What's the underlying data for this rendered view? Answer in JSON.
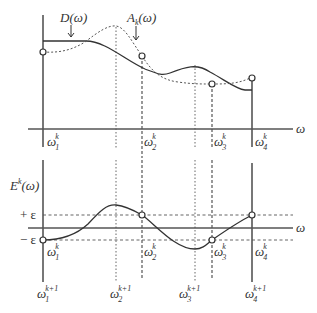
{
  "top_plot": {
    "label_D": "D(ω)",
    "label_A": "A",
    "label_A_sub": "k",
    "label_A_arg": "(ω)",
    "x_axis_label": "ω",
    "nodes": [
      {
        "base": "ω",
        "sub": "1",
        "sup": "k"
      },
      {
        "base": "ω",
        "sub": "2",
        "sup": "k"
      },
      {
        "base": "ω",
        "sub": "3",
        "sup": "k"
      },
      {
        "base": "ω",
        "sub": "4",
        "sup": "k"
      }
    ]
  },
  "bottom_plot": {
    "y_label": "E",
    "y_label_sup": "k",
    "y_label_arg": "(ω)",
    "x_axis_label": "ω",
    "plus_eps": "+ ε",
    "minus_eps": "− ε",
    "nodes_k": [
      {
        "base": "ω",
        "sub": "1",
        "sup": "k"
      },
      {
        "base": "ω",
        "sub": "2",
        "sup": "k"
      },
      {
        "base": "ω",
        "sub": "3",
        "sup": "k"
      },
      {
        "base": "ω",
        "sub": "4",
        "sup": "k"
      }
    ],
    "nodes_k1": [
      {
        "base": "ω",
        "sub": "1",
        "sup": "k+1"
      },
      {
        "base": "ω",
        "sub": "2",
        "sup": "k+1"
      },
      {
        "base": "ω",
        "sub": "3",
        "sup": "k+1"
      },
      {
        "base": "ω",
        "sub": "4",
        "sup": "k+1"
      }
    ]
  }
}
